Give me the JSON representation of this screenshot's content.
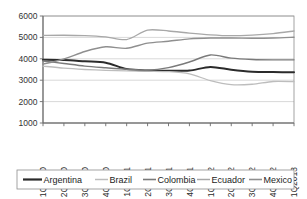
{
  "chart_data": {
    "type": "line",
    "title": "",
    "xlabel": "",
    "ylabel": "",
    "ylim": [
      1000,
      6000
    ],
    "ytick_values": [
      1000,
      2000,
      3000,
      4000,
      5000,
      6000
    ],
    "ytick_labels": [
      "1000",
      "2000",
      "3000",
      "4000",
      "5000",
      "6000"
    ],
    "grid": true,
    "legend_position": "bottom",
    "categories": [
      "1Q2010",
      "2Q2010",
      "3Q2010",
      "4Q2010",
      "1Q2011",
      "2Q2011",
      "3Q2011",
      "4Q2011",
      "1Q2012",
      "2Q2012",
      "3Q2012",
      "4Q2012",
      "1Q2013"
    ],
    "series": [
      {
        "name": "Argentina",
        "color": "#2b2b2b",
        "width": 2.0,
        "values": [
          3960,
          3940,
          3880,
          3820,
          3520,
          3450,
          3440,
          3450,
          3620,
          3490,
          3400,
          3380,
          3370
        ]
      },
      {
        "name": "Brazil",
        "color": "#bdbdbd",
        "width": 1.3,
        "values": [
          3660,
          3560,
          3500,
          3460,
          3440,
          3420,
          3400,
          3300,
          2980,
          2790,
          2810,
          2940,
          2930
        ]
      },
      {
        "name": "Colombia",
        "color": "#7a7a7a",
        "width": 1.4,
        "values": [
          3900,
          3780,
          3660,
          3580,
          3510,
          3470,
          3590,
          3850,
          4180,
          4030,
          3970,
          3950,
          3950
        ]
      },
      {
        "name": "Ecuador",
        "color": "#a8a8a8",
        "width": 1.3,
        "values": [
          5090,
          5100,
          5080,
          5020,
          4900,
          5340,
          5300,
          5200,
          5120,
          5080,
          5110,
          5180,
          5300
        ]
      },
      {
        "name": "Mexico",
        "color": "#8f8f8f",
        "width": 1.4,
        "values": [
          3750,
          3990,
          4340,
          4560,
          4490,
          4730,
          4820,
          4930,
          4970,
          4970,
          4960,
          4970,
          5010
        ]
      }
    ]
  },
  "legend": {
    "items": [
      {
        "label": "Argentina"
      },
      {
        "label": "Brazil"
      },
      {
        "label": "Colombia"
      },
      {
        "label": "Ecuador"
      },
      {
        "label": "Mexico"
      }
    ]
  }
}
